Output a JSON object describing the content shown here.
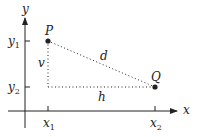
{
  "diagram": {
    "axes": {
      "x_label": "x",
      "y_label": "y"
    },
    "ticks": {
      "x1": {
        "base": "x",
        "sub": "1"
      },
      "x2": {
        "base": "x",
        "sub": "2"
      },
      "y1": {
        "base": "y",
        "sub": "1"
      },
      "y2": {
        "base": "y",
        "sub": "2"
      }
    },
    "points": {
      "P": {
        "label": "P"
      },
      "Q": {
        "label": "Q"
      }
    },
    "segments": {
      "distance": "d",
      "horizontal": "h",
      "vertical": "v"
    },
    "colors": {
      "stroke": "#222222",
      "background": "#ffffff"
    }
  }
}
